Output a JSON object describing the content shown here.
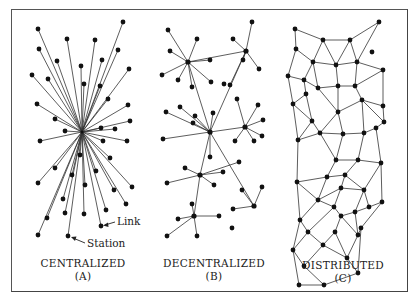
{
  "panels": [
    {
      "id": "A",
      "title": "CENTRALIZED",
      "letter": "(A)"
    },
    {
      "id": "B",
      "title": "DECENTRALIZED",
      "letter": "(B)"
    },
    {
      "id": "C",
      "title": "DISTRIBUTED",
      "letter": "(C)"
    }
  ],
  "annotations": {
    "link": "Link",
    "station": "Station"
  },
  "colors": {
    "node": "#111111",
    "edge": "#333333",
    "border": "#555555",
    "background": "#ffffff"
  },
  "centralized": {
    "hub": [
      82,
      132
    ],
    "nodes": [
      [
        38,
        29
      ],
      [
        123,
        22
      ],
      [
        67,
        39
      ],
      [
        95,
        40
      ],
      [
        39,
        49
      ],
      [
        118,
        50
      ],
      [
        57,
        61
      ],
      [
        81,
        66
      ],
      [
        102,
        60
      ],
      [
        129,
        69
      ],
      [
        32,
        75
      ],
      [
        48,
        79
      ],
      [
        84,
        84
      ],
      [
        100,
        86
      ],
      [
        108,
        99
      ],
      [
        37,
        104
      ],
      [
        128,
        105
      ],
      [
        55,
        119
      ],
      [
        130,
        121
      ],
      [
        65,
        131
      ],
      [
        101,
        128
      ],
      [
        115,
        129
      ],
      [
        40,
        141
      ],
      [
        103,
        141
      ],
      [
        127,
        141
      ],
      [
        80,
        155
      ],
      [
        110,
        158
      ],
      [
        55,
        168
      ],
      [
        72,
        175
      ],
      [
        96,
        171
      ],
      [
        38,
        183
      ],
      [
        85,
        185
      ],
      [
        132,
        187
      ],
      [
        114,
        190
      ],
      [
        63,
        199
      ],
      [
        126,
        204
      ],
      [
        84,
        214
      ],
      [
        65,
        213
      ],
      [
        106,
        210
      ],
      [
        47,
        218
      ],
      [
        101,
        226
      ],
      [
        38,
        235
      ],
      [
        68,
        236
      ]
    ]
  },
  "decentralized": {
    "hubs": [
      [
        188,
        62
      ],
      [
        246,
        51
      ],
      [
        210,
        132
      ],
      [
        245,
        127
      ],
      [
        200,
        175
      ],
      [
        254,
        206
      ],
      [
        194,
        216
      ]
    ],
    "nodes": [
      [
        168,
        30
      ],
      [
        197,
        39
      ],
      [
        170,
        51
      ],
      [
        210,
        60
      ],
      [
        162,
        75
      ],
      [
        178,
        80
      ],
      [
        192,
        87
      ],
      [
        211,
        82
      ],
      [
        224,
        84
      ],
      [
        233,
        39
      ],
      [
        252,
        22
      ],
      [
        243,
        60
      ],
      [
        259,
        69
      ],
      [
        230,
        85
      ],
      [
        166,
        112
      ],
      [
        180,
        107
      ],
      [
        195,
        116
      ],
      [
        193,
        123
      ],
      [
        213,
        113
      ],
      [
        237,
        99
      ],
      [
        258,
        105
      ],
      [
        263,
        120
      ],
      [
        262,
        136
      ],
      [
        235,
        141
      ],
      [
        254,
        141
      ],
      [
        163,
        139
      ],
      [
        210,
        157
      ],
      [
        239,
        162
      ],
      [
        185,
        168
      ],
      [
        223,
        172
      ],
      [
        214,
        185
      ],
      [
        167,
        183
      ],
      [
        242,
        190
      ],
      [
        262,
        187
      ],
      [
        233,
        209
      ],
      [
        192,
        204
      ],
      [
        178,
        219
      ],
      [
        219,
        216
      ],
      [
        167,
        236
      ],
      [
        197,
        236
      ],
      [
        232,
        228
      ]
    ],
    "edges": [
      [
        0,
        0
      ],
      [
        0,
        1
      ],
      [
        0,
        2
      ],
      [
        0,
        3
      ],
      [
        0,
        4
      ],
      [
        0,
        5
      ],
      [
        0,
        6
      ],
      [
        0,
        7
      ],
      [
        1,
        9
      ],
      [
        1,
        10
      ],
      [
        1,
        11
      ],
      [
        1,
        12
      ],
      [
        1,
        13
      ],
      [
        2,
        14
      ],
      [
        2,
        15
      ],
      [
        2,
        16
      ],
      [
        2,
        17
      ],
      [
        2,
        18
      ],
      [
        2,
        26
      ],
      [
        3,
        19
      ],
      [
        3,
        20
      ],
      [
        3,
        21
      ],
      [
        3,
        22
      ],
      [
        3,
        23
      ],
      [
        3,
        24
      ],
      [
        2,
        25
      ],
      [
        4,
        27
      ],
      [
        4,
        28
      ],
      [
        4,
        29
      ],
      [
        4,
        30
      ],
      [
        4,
        31
      ],
      [
        5,
        32
      ],
      [
        5,
        33
      ],
      [
        5,
        34
      ],
      [
        6,
        35
      ],
      [
        6,
        36
      ],
      [
        6,
        37
      ],
      [
        6,
        38
      ],
      [
        6,
        39
      ]
    ],
    "hub_links": [
      [
        0,
        1
      ],
      [
        0,
        2
      ],
      [
        1,
        2
      ],
      [
        2,
        3
      ],
      [
        2,
        4
      ],
      [
        2,
        5
      ],
      [
        4,
        6
      ]
    ]
  },
  "distributed": {
    "nodes": [
      [
        295,
        29
      ],
      [
        379,
        22
      ],
      [
        323,
        40
      ],
      [
        350,
        40
      ],
      [
        296,
        49
      ],
      [
        372,
        52
      ],
      [
        313,
        62
      ],
      [
        336,
        65
      ],
      [
        357,
        62
      ],
      [
        383,
        70
      ],
      [
        288,
        76
      ],
      [
        304,
        80
      ],
      [
        318,
        88
      ],
      [
        338,
        86
      ],
      [
        355,
        86
      ],
      [
        306,
        94
      ],
      [
        293,
        104
      ],
      [
        362,
        100
      ],
      [
        383,
        106
      ],
      [
        338,
        112
      ],
      [
        312,
        121
      ],
      [
        384,
        122
      ],
      [
        320,
        133
      ],
      [
        343,
        134
      ],
      [
        364,
        133
      ],
      [
        376,
        128
      ],
      [
        298,
        140
      ],
      [
        336,
        160
      ],
      [
        358,
        160
      ],
      [
        381,
        163
      ],
      [
        327,
        177
      ],
      [
        345,
        175
      ],
      [
        364,
        190
      ],
      [
        297,
        182
      ],
      [
        318,
        200
      ],
      [
        341,
        188
      ],
      [
        369,
        207
      ],
      [
        382,
        202
      ],
      [
        300,
        220
      ],
      [
        334,
        207
      ],
      [
        355,
        212
      ],
      [
        341,
        216
      ],
      [
        308,
        232
      ],
      [
        358,
        235
      ],
      [
        293,
        250
      ],
      [
        323,
        245
      ],
      [
        335,
        232
      ],
      [
        361,
        228
      ],
      [
        304,
        266
      ],
      [
        347,
        258
      ],
      [
        299,
        285
      ],
      [
        324,
        285
      ],
      [
        358,
        273
      ]
    ],
    "edges": [
      [
        0,
        2
      ],
      [
        2,
        3
      ],
      [
        3,
        1
      ],
      [
        0,
        4
      ],
      [
        2,
        6
      ],
      [
        2,
        7
      ],
      [
        3,
        7
      ],
      [
        3,
        8
      ],
      [
        1,
        8
      ],
      [
        4,
        6
      ],
      [
        4,
        10
      ],
      [
        6,
        7
      ],
      [
        7,
        8
      ],
      [
        8,
        9
      ],
      [
        6,
        11
      ],
      [
        10,
        11
      ],
      [
        11,
        12
      ],
      [
        6,
        12
      ],
      [
        7,
        13
      ],
      [
        12,
        13
      ],
      [
        13,
        14
      ],
      [
        9,
        14
      ],
      [
        8,
        14
      ],
      [
        10,
        16
      ],
      [
        11,
        15
      ],
      [
        15,
        16
      ],
      [
        12,
        19
      ],
      [
        15,
        20
      ],
      [
        16,
        20
      ],
      [
        13,
        19
      ],
      [
        14,
        17
      ],
      [
        17,
        19
      ],
      [
        17,
        18
      ],
      [
        9,
        18
      ],
      [
        17,
        21
      ],
      [
        18,
        21
      ],
      [
        20,
        22
      ],
      [
        19,
        22
      ],
      [
        19,
        23
      ],
      [
        22,
        23
      ],
      [
        23,
        24
      ],
      [
        24,
        25
      ],
      [
        21,
        25
      ],
      [
        17,
        24
      ],
      [
        16,
        26
      ],
      [
        20,
        26
      ],
      [
        22,
        26
      ],
      [
        22,
        27
      ],
      [
        23,
        27
      ],
      [
        27,
        28
      ],
      [
        24,
        28
      ],
      [
        28,
        29
      ],
      [
        25,
        29
      ],
      [
        26,
        33
      ],
      [
        27,
        30
      ],
      [
        30,
        31
      ],
      [
        28,
        31
      ],
      [
        30,
        33
      ],
      [
        31,
        32
      ],
      [
        29,
        32
      ],
      [
        32,
        36
      ],
      [
        29,
        37
      ],
      [
        36,
        37
      ],
      [
        33,
        34
      ],
      [
        30,
        34
      ],
      [
        34,
        35
      ],
      [
        31,
        35
      ],
      [
        35,
        32
      ],
      [
        34,
        38
      ],
      [
        33,
        38
      ],
      [
        35,
        39
      ],
      [
        39,
        41
      ],
      [
        34,
        39
      ],
      [
        32,
        40
      ],
      [
        36,
        40
      ],
      [
        40,
        41
      ],
      [
        38,
        42
      ],
      [
        39,
        42
      ],
      [
        41,
        43
      ],
      [
        40,
        43
      ],
      [
        37,
        47
      ],
      [
        43,
        47
      ],
      [
        38,
        44
      ],
      [
        42,
        44
      ],
      [
        42,
        45
      ],
      [
        45,
        46
      ],
      [
        41,
        46
      ],
      [
        46,
        49
      ],
      [
        43,
        49
      ],
      [
        47,
        52
      ],
      [
        49,
        52
      ],
      [
        44,
        48
      ],
      [
        45,
        48
      ],
      [
        48,
        51
      ],
      [
        44,
        50
      ],
      [
        50,
        51
      ],
      [
        51,
        52
      ],
      [
        45,
        49
      ]
    ]
  },
  "label_positions": {
    "link": {
      "x": 116,
      "y": 218,
      "arrow_from": [
        115,
        222
      ],
      "arrow_to": [
        104,
        225
      ]
    },
    "station": {
      "x": 86,
      "y": 239,
      "arrow_from": [
        85,
        243
      ],
      "arrow_to": [
        72,
        237
      ]
    }
  }
}
